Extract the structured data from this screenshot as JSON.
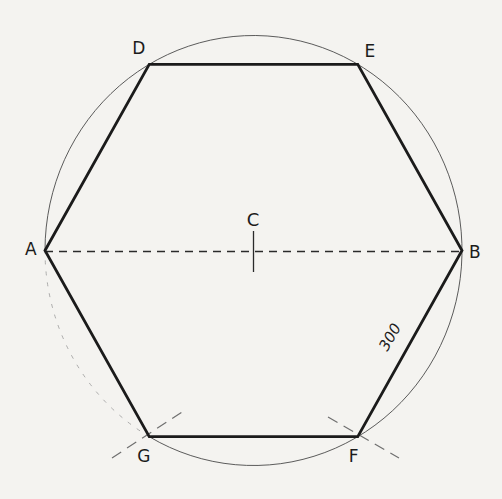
{
  "figure": {
    "background_color": "#f4f3f0",
    "ink_color": "#1b1b1b",
    "circle_color": "#4a4a4a",
    "construction_color": "#6f6f6f",
    "faint_arc_color": "#9a9a9a",
    "center": {
      "x": 253.5,
      "y": 250.5,
      "label": "C",
      "label_x": 253,
      "label_y": 219
    },
    "center_tick": {
      "x": 253.5,
      "y1": 231,
      "y2": 272
    },
    "radius": {
      "rx": 208.5,
      "ry": 215
    },
    "vertices": [
      {
        "label": "A",
        "angle_deg": 180,
        "label_x": 31,
        "label_y": 249
      },
      {
        "label": "D",
        "angle_deg": 120,
        "label_x": 139,
        "label_y": 48
      },
      {
        "label": "E",
        "angle_deg": 60,
        "label_x": 370,
        "label_y": 51
      },
      {
        "label": "B",
        "angle_deg": 0,
        "label_x": 475,
        "label_y": 252
      },
      {
        "label": "F",
        "angle_deg": -60,
        "label_x": 354,
        "label_y": 456
      },
      {
        "label": "G",
        "angle_deg": -120,
        "label_x": 144,
        "label_y": 456
      }
    ],
    "polygon_order": [
      "A",
      "D",
      "E",
      "B",
      "F",
      "G"
    ],
    "diameter": {
      "from": "A",
      "to": "B",
      "style": "dashed"
    },
    "faint_arc": {
      "from_deg": -120,
      "to_deg": 180
    },
    "construction_marks": [
      {
        "x1": 112,
        "y1": 458,
        "x2": 182,
        "y2": 412
      },
      {
        "x1": 328,
        "y1": 417,
        "x2": 399,
        "y2": 458
      }
    ],
    "dimension": {
      "text": "300",
      "x": 390,
      "y": 337,
      "rotation_deg": -60
    }
  }
}
